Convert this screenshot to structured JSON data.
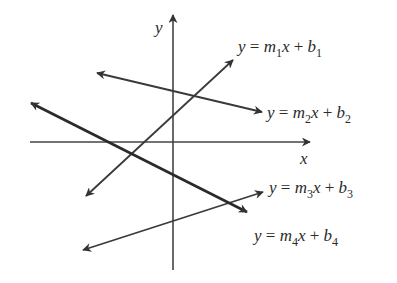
{
  "diagram": {
    "title": "",
    "axes": {
      "x_label": "x",
      "y_label": "y"
    },
    "lines": [
      {
        "id": "line-1",
        "equation": "y = m1x + b1",
        "parts": {
          "y": "y",
          "eq": "=",
          "m": "m",
          "m_sub": "1",
          "x": "x",
          "plus": "+",
          "b": "b",
          "b_sub": "1"
        },
        "slope_sign": "positive",
        "arrow": "one end (upper right)"
      },
      {
        "id": "line-2",
        "equation": "y = m2x + b2",
        "parts": {
          "y": "y",
          "eq": "=",
          "m": "m",
          "m_sub": "2",
          "x": "x",
          "plus": "+",
          "b": "b",
          "b_sub": "2"
        },
        "slope_sign": "negative",
        "arrow": "both ends"
      },
      {
        "id": "line-3",
        "equation": "y = m3x + b3",
        "parts": {
          "y": "y",
          "eq": "=",
          "m": "m",
          "m_sub": "3",
          "x": "x",
          "plus": "+",
          "b": "b",
          "b_sub": "3"
        },
        "slope_sign": "positive",
        "arrow": "both ends"
      },
      {
        "id": "line-4",
        "equation": "y = m4x + b4",
        "parts": {
          "y": "y",
          "eq": "=",
          "m": "m",
          "m_sub": "4",
          "x": "x",
          "plus": "+",
          "b": "b",
          "b_sub": "4"
        },
        "slope_sign": "negative",
        "arrow": "both ends"
      }
    ],
    "colors": {
      "line": "#3a3a3a",
      "axis": "#333333",
      "text": "#2b2b2b",
      "background": "#ffffff"
    }
  }
}
